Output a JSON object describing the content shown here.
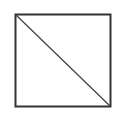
{
  "diagram": {
    "shape": "square-with-diagonal",
    "stroke_color": "#333333",
    "background": "#ffffff"
  }
}
